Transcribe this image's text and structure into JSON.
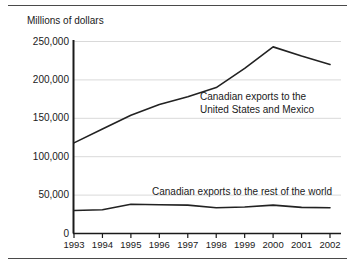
{
  "figure": {
    "axis_title": "Millions of dollars",
    "has_top_rule": true,
    "has_bottom_rule": true,
    "line_color": "#222222",
    "grid_color": "#d9d9d9",
    "axis_color": "#1a1a1a",
    "background": "#ffffff"
  },
  "chart_data": {
    "type": "line",
    "title": "",
    "subtitle": "",
    "xlabel": "",
    "ylabel": "Millions of dollars",
    "x": [
      "1993",
      "1994",
      "1995",
      "1996",
      "1997",
      "1998",
      "1999",
      "2000",
      "2001",
      "2002"
    ],
    "categories": [
      "1993",
      "1994",
      "1995",
      "1996",
      "1997",
      "1998",
      "1999",
      "2000",
      "2001",
      "2002"
    ],
    "ylim": [
      0,
      250000
    ],
    "yticks": [
      0,
      50000,
      100000,
      150000,
      200000,
      250000
    ],
    "ytick_labels": [
      "0",
      "50,000",
      "100,000",
      "150,000",
      "200,000",
      "250,000"
    ],
    "grid": "horizontal",
    "legend": "inline-annotations",
    "series": [
      {
        "name": "Canadian exports to the United States and Mexico",
        "label_lines": [
          "Canadian exports to the",
          "United States and Mexico"
        ],
        "values": [
          118000,
          136000,
          154000,
          168000,
          178000,
          190000,
          215000,
          243000,
          231000,
          220000
        ]
      },
      {
        "name": "Canadian exports to the rest of the world",
        "label_lines": [
          "Canadian exports to the rest of the world"
        ],
        "values": [
          30000,
          31000,
          38000,
          37500,
          37000,
          33500,
          34500,
          37000,
          34000,
          33500
        ]
      }
    ]
  }
}
